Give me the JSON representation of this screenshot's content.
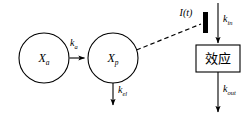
{
  "diagram": {
    "type": "pkpd-compartment-model",
    "background_color": "#ffffff",
    "stroke_color": "#000000",
    "nodes": [
      {
        "id": "xa",
        "shape": "circle",
        "base": "X",
        "subscript": "a",
        "cx": 44,
        "cy": 58,
        "r": 25
      },
      {
        "id": "xp",
        "shape": "circle",
        "base": "X",
        "subscript": "p",
        "cx": 113,
        "cy": 58,
        "r": 25
      },
      {
        "id": "effect",
        "shape": "rect",
        "label": "效应",
        "x": 196,
        "y": 45,
        "width": 44,
        "height": 27
      }
    ],
    "bar": {
      "id": "inhibition-bar",
      "x": 203,
      "y": 12,
      "width": 5,
      "height": 21,
      "fill": "#000000"
    },
    "edges": [
      {
        "id": "xa-to-xp",
        "from": "xa",
        "to": "xp",
        "style": "solid",
        "arrow": true,
        "label_base": "k",
        "label_subscript": "a"
      },
      {
        "id": "xp-elimination",
        "from": "xp",
        "to": "out",
        "style": "solid",
        "arrow": true,
        "label_base": "k",
        "label_subscript": "el"
      },
      {
        "id": "xp-to-bar",
        "from": "xp",
        "to": "inhibition-bar",
        "style": "dashed",
        "arrow": false,
        "label_base": "",
        "label_subscript": ""
      },
      {
        "id": "kin-into-effect",
        "from": "source",
        "to": "effect",
        "style": "solid",
        "arrow": true,
        "label_base": "k",
        "label_subscript": "in"
      },
      {
        "id": "kout-from-effect",
        "from": "effect",
        "to": "out",
        "style": "solid",
        "arrow": true,
        "label_base": "k",
        "label_subscript": "out"
      }
    ],
    "annotations": [
      {
        "id": "input-function",
        "base": "I",
        "paren_open": "(",
        "var": "t",
        "paren_close": ")",
        "x": 186,
        "y": 15
      }
    ]
  }
}
